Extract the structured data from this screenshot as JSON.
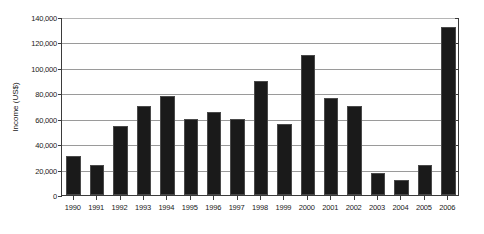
{
  "chart_data": {
    "type": "bar",
    "title": "",
    "xlabel": "",
    "ylabel": "Income (US$)",
    "ylim": [
      0,
      140000
    ],
    "ytick_step": 20000,
    "grid": true,
    "legend": null,
    "bar_color": "#1a1a1a",
    "ytick_labels": [
      "140,000",
      "120,000",
      "100,000",
      "80,000",
      "60,000",
      "40,000",
      "20,000",
      "0"
    ],
    "ytick_values": [
      140000,
      120000,
      100000,
      80000,
      60000,
      40000,
      20000,
      0
    ],
    "categories": [
      "1990",
      "1991",
      "1992",
      "1993",
      "1994",
      "1995",
      "1996",
      "1997",
      "1998",
      "1999",
      "2000",
      "2001",
      "2002",
      "2003",
      "2004",
      "2005",
      "2006"
    ],
    "values": [
      31000,
      24000,
      54000,
      70000,
      78000,
      60000,
      65000,
      60000,
      90000,
      56000,
      110000,
      76000,
      70000,
      17000,
      12000,
      24000,
      132000
    ]
  }
}
